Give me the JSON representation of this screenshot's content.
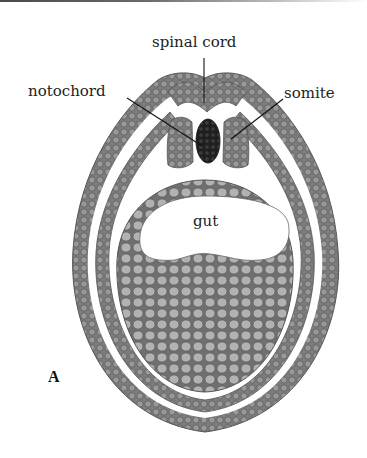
{
  "figure": {
    "panel_label": "A",
    "labels": {
      "spinal_cord": "spinal cord",
      "notochord": "notochord",
      "somite": "somite",
      "gut": "gut"
    },
    "colors": {
      "cell_fill": "#8c8c8c",
      "cell_outline": "#555555",
      "yolk_fill": "#a9a9a9",
      "notochord_fill": "#2f2f2f",
      "leader_line": "#111111",
      "background": "#ffffff"
    }
  }
}
